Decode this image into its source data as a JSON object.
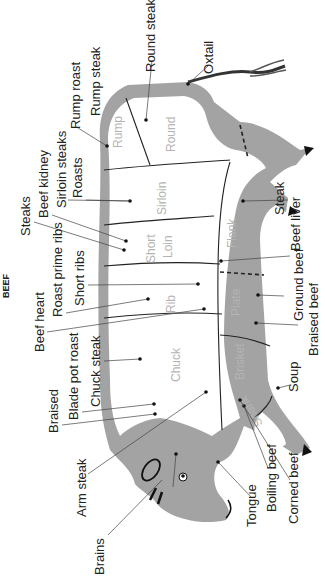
{
  "title": "BEEF",
  "colors": {
    "body_fill": "#a3a3a3",
    "inner_fill": "#ffffff",
    "cut_label": "#b4b4b4",
    "text": "#222222"
  },
  "cuts": [
    {
      "name": "Rump"
    },
    {
      "name": "Round"
    },
    {
      "name": "Sirloin"
    },
    {
      "name": "Short Loin"
    },
    {
      "name": "Flank"
    },
    {
      "name": "Rib"
    },
    {
      "name": "Plate"
    },
    {
      "name": "Chuck"
    },
    {
      "name": "Brisket"
    },
    {
      "name": "Shank"
    }
  ],
  "labels": {
    "round_steak": "Round steak",
    "oxtail": "Oxtail",
    "rump_roast": "Rump roast",
    "rump_steak": "Rump steak",
    "roasts": "Roasts",
    "sirloin_steaks": "Sirloin steaks",
    "beef_kidney": "Beef kidney",
    "steaks": "Steaks",
    "short_ribs": "Short ribs",
    "roast_prime_ribs": "Roast prime ribs",
    "beef_heart": "Beef heart",
    "chuck_steak": "Chuck steak",
    "blade_pot_roast": "Blade pot roast",
    "braised": "Braised",
    "arm_steak": "Arm steak",
    "brains": "Brains",
    "tongue": "Tongue",
    "boiling_beef": "Boiling beef",
    "corned_beef": "Corned beef",
    "soup": "Soup",
    "braised_beef": "Braised beef",
    "ground_beef": "Ground beef",
    "beef_liver": "Beef liver",
    "steak": "Steak"
  },
  "cut_labels": {
    "rump": "Rump",
    "round": "Round",
    "sirloin": "Sirloin",
    "short": "Short",
    "loin": "Loin",
    "flank": "Flank",
    "rib": "Rib",
    "plate": "Plate",
    "chuck": "Chuck",
    "brisket": "Brisket",
    "shank": "Shank"
  }
}
